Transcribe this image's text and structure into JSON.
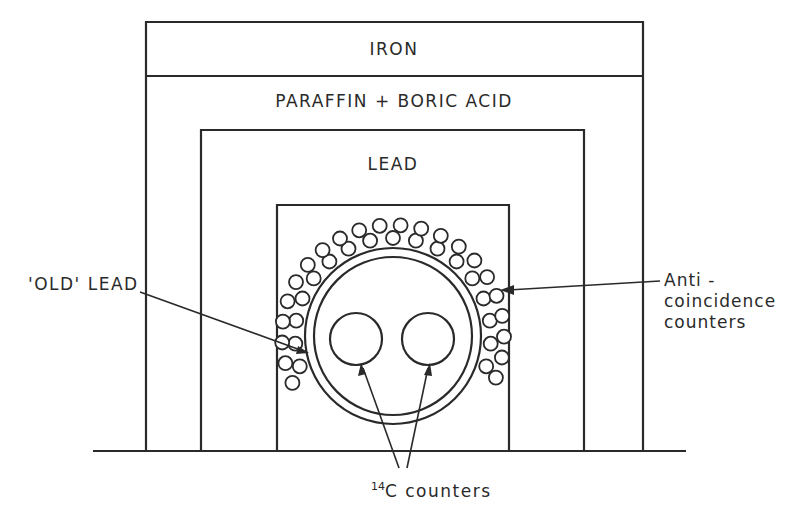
{
  "diagram": {
    "title": "",
    "layers": [
      {
        "id": "iron",
        "label": "IRON"
      },
      {
        "id": "paraffin",
        "label": "PARAFFIN + BORIC  ACID"
      },
      {
        "id": "lead",
        "label": "LEAD"
      },
      {
        "id": "old-lead",
        "label": "'OLD' LEAD"
      }
    ],
    "annotations": {
      "anti_line1": "Anti -",
      "anti_line2": "coincidence",
      "anti_line3": "counters",
      "c14_sup": "14",
      "c14_text": "C  counters"
    },
    "colors": {
      "ink": "#2a2a2a",
      "background": "#ffffff"
    }
  }
}
